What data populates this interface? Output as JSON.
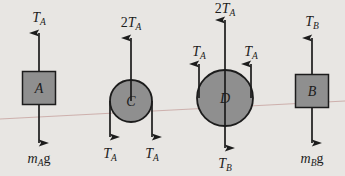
{
  "figure": {
    "name": "free-body-diagram-pulley-system",
    "background_color": "#e8e6e3",
    "stroke_color": "#1c1c1c",
    "body_fill_color": "#8f8f8f",
    "guide_line_color": "#c9a9a6",
    "width": 345,
    "height": 176
  },
  "bodies": [
    {
      "id": "A",
      "shape": "square",
      "label": "A",
      "cx": 39,
      "cy": 88,
      "size": 33,
      "forces": [
        {
          "id": "A-up",
          "label_main": "T",
          "label_sub": "A",
          "label_prefix": "",
          "label_suffix": "",
          "direction": "up",
          "x": 39,
          "tail_y": 71,
          "head_y": 33,
          "text_x": 39,
          "text_y": 22,
          "anchor": "middle"
        },
        {
          "id": "A-down",
          "label_main": "m",
          "label_sub": "A",
          "label_prefix": "",
          "label_suffix": "g",
          "direction": "down",
          "x": 39,
          "tail_y": 105,
          "head_y": 143,
          "text_x": 39,
          "text_y": 163,
          "anchor": "middle"
        }
      ]
    },
    {
      "id": "C",
      "shape": "circle",
      "label": "C",
      "cx": 131,
      "cy": 101,
      "radius": 21,
      "forces": [
        {
          "id": "C-up",
          "label_main": "T",
          "label_sub": "A",
          "label_prefix": "2",
          "label_suffix": "",
          "direction": "up",
          "x": 131,
          "tail_y": 101,
          "head_y": 38,
          "text_x": 131,
          "text_y": 27,
          "anchor": "middle"
        },
        {
          "id": "C-down-left",
          "label_main": "T",
          "label_sub": "A",
          "label_prefix": "",
          "label_suffix": "",
          "direction": "down",
          "x": 110,
          "tail_y": 101,
          "head_y": 137,
          "text_x": 110,
          "text_y": 158,
          "anchor": "middle"
        },
        {
          "id": "C-down-right",
          "label_main": "T",
          "label_sub": "A",
          "label_prefix": "",
          "label_suffix": "",
          "direction": "down",
          "x": 152,
          "tail_y": 101,
          "head_y": 137,
          "text_x": 152,
          "text_y": 158,
          "anchor": "middle"
        }
      ]
    },
    {
      "id": "D",
      "shape": "circle",
      "label": "D",
      "cx": 225,
      "cy": 98,
      "radius": 28,
      "forces": [
        {
          "id": "D-up-center",
          "label_main": "T",
          "label_sub": "A",
          "label_prefix": "2",
          "label_suffix": "",
          "direction": "up",
          "x": 225,
          "tail_y": 98,
          "head_y": 20,
          "text_x": 225,
          "text_y": 13,
          "anchor": "middle"
        },
        {
          "id": "D-up-left",
          "label_main": "T",
          "label_sub": "A",
          "label_prefix": "",
          "label_suffix": "",
          "direction": "up",
          "x": 199,
          "tail_y": 98,
          "head_y": 64,
          "text_x": 199,
          "text_y": 56,
          "anchor": "middle"
        },
        {
          "id": "D-up-right",
          "label_main": "T",
          "label_sub": "A",
          "label_prefix": "",
          "label_suffix": "",
          "direction": "up",
          "x": 251,
          "tail_y": 98,
          "head_y": 64,
          "text_x": 251,
          "text_y": 56,
          "anchor": "middle"
        },
        {
          "id": "D-down",
          "label_main": "T",
          "label_sub": "B",
          "label_prefix": "",
          "label_suffix": "",
          "direction": "down",
          "x": 225,
          "tail_y": 98,
          "head_y": 148,
          "text_x": 225,
          "text_y": 168,
          "anchor": "middle"
        }
      ]
    },
    {
      "id": "B",
      "shape": "square",
      "label": "B",
      "cx": 312,
      "cy": 91,
      "size": 33,
      "forces": [
        {
          "id": "B-up",
          "label_main": "T",
          "label_sub": "B",
          "label_prefix": "",
          "label_suffix": "",
          "direction": "up",
          "x": 312,
          "tail_y": 74,
          "head_y": 38,
          "text_x": 312,
          "text_y": 26,
          "anchor": "middle"
        },
        {
          "id": "B-down",
          "label_main": "m",
          "label_sub": "B",
          "label_prefix": "",
          "label_suffix": "g",
          "direction": "down",
          "x": 312,
          "tail_y": 108,
          "head_y": 143,
          "text_x": 312,
          "text_y": 163,
          "anchor": "middle"
        }
      ]
    }
  ],
  "guide_line": {
    "name": "background-page-rule",
    "x1": 0,
    "y1": 119,
    "x2": 345,
    "y2": 101
  }
}
